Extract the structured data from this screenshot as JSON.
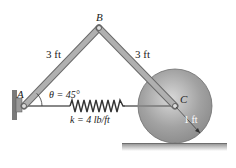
{
  "diagram": {
    "points": {
      "A": {
        "label": "A"
      },
      "B": {
        "label": "B"
      },
      "C": {
        "label": "C"
      }
    },
    "links": [
      {
        "id": "AB",
        "length_label": "3 ft"
      },
      {
        "id": "BC",
        "length_label": "3 ft"
      }
    ],
    "angle": {
      "symbol": "θ",
      "text": "θ = 45°"
    },
    "spring": {
      "text": "k = 4 lb/ft"
    },
    "disk": {
      "radius_label": "1 ft"
    },
    "colors": {
      "link": "#a8a8a8",
      "link_edge": "#6a6a6a",
      "disk": "#9a9a9a",
      "ground": "#8a8a8a",
      "spring": "#333333",
      "wall": "#7a7a7a"
    }
  }
}
